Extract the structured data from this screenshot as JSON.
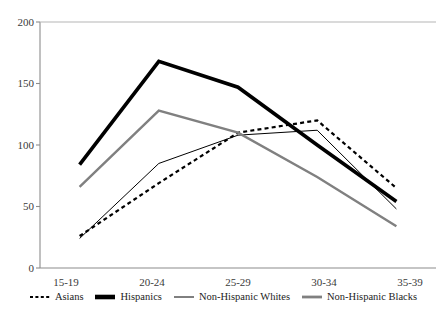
{
  "chart_data": {
    "type": "line",
    "title": "",
    "xlabel": "",
    "ylabel": "",
    "categories": [
      "15-19",
      "20-24",
      "25-29",
      "30-34",
      "35-39"
    ],
    "ylim": [
      0,
      200
    ],
    "yticks": [
      0,
      50,
      100,
      150,
      200
    ],
    "grid": false,
    "legend_position": "bottom",
    "series": [
      {
        "name": "Asians",
        "style": "dotted",
        "color": "#000000",
        "values": [
          26,
          69,
          110,
          120,
          65
        ]
      },
      {
        "name": "Hispanics",
        "style": "thick-solid",
        "color": "#000000",
        "values": [
          84,
          168,
          147,
          100,
          54
        ]
      },
      {
        "name": "Non-Hispanic Whites",
        "style": "thin-solid",
        "color": "#000000",
        "values": [
          24,
          85,
          108,
          112,
          48
        ]
      },
      {
        "name": "Non-Hispanic Blacks",
        "style": "medium-gray",
        "color": "#808080",
        "values": [
          66,
          128,
          110,
          74,
          34
        ]
      }
    ]
  },
  "axes": {
    "ytick_labels": [
      "200",
      "150",
      "100",
      "50",
      "0"
    ],
    "xtick_labels": [
      "15-19",
      "20-24",
      "25-29",
      "30-34",
      "35-39"
    ]
  },
  "legend": {
    "items": [
      {
        "label": "Asians",
        "swatch": "dotted-line-swatch"
      },
      {
        "label": "Hispanics",
        "swatch": "thick-black-line-swatch"
      },
      {
        "label": "Non-Hispanic Whites",
        "swatch": "thin-black-line-swatch"
      },
      {
        "label": "Non-Hispanic Blacks",
        "swatch": "gray-line-swatch"
      }
    ]
  },
  "colors": {
    "axis": "#8c8c8c",
    "black": "#000000",
    "gray": "#808080",
    "background": "#ffffff"
  }
}
